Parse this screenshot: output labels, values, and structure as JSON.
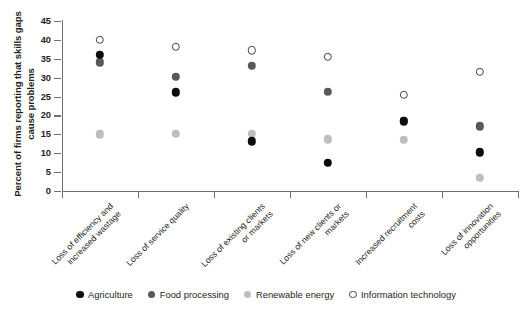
{
  "chart_data": {
    "type": "scatter",
    "title": "",
    "xlabel": "",
    "ylabel": "Percent of firms reporting that skills gaps cause problems",
    "ylim": [
      0,
      45
    ],
    "yticks": [
      0,
      5,
      10,
      15,
      20,
      25,
      30,
      35,
      40,
      45
    ],
    "grid": false,
    "legend_position": "bottom",
    "categories": [
      "Loss of efficiency and increased wastage",
      "Loss of service quality",
      "Loss of existing clients or markets",
      "Loss of new clients or markets",
      "Increased recruitment costs",
      "Loss of innovation opportunities"
    ],
    "category_lines": [
      [
        "Loss of efficiency and",
        "increased wastage"
      ],
      [
        "Loss of service quality"
      ],
      [
        "Loss of existing clients",
        "or markets"
      ],
      [
        "Loss of new clients or",
        "markets"
      ],
      [
        "Increased recruitment",
        "costs"
      ],
      [
        "Loss of innovation",
        "opportunities"
      ]
    ],
    "series": [
      {
        "name": "Agriculture",
        "color": "#0d0d0d",
        "marker": "filled-circle",
        "values": [
          36.0,
          26.1,
          13.2,
          7.5,
          18.5,
          10.2
        ]
      },
      {
        "name": "Food processing",
        "color": "#58595b",
        "marker": "filled-circle",
        "values": [
          34.1,
          30.3,
          33.2,
          26.2,
          18.6,
          17.1
        ]
      },
      {
        "name": "Renewable energy",
        "color": "#bcbec0",
        "marker": "filled-circle",
        "values": [
          15.0,
          15.1,
          15.2,
          13.7,
          13.6,
          3.5
        ]
      },
      {
        "name": "Information technology",
        "color": "#ffffff",
        "marker": "open-circle",
        "values": [
          40.1,
          38.1,
          37.2,
          35.6,
          25.5,
          31.5
        ]
      }
    ]
  },
  "axis": {
    "y_title": "Percent of firms reporting that skills gaps cause problems"
  },
  "legend": {
    "items": [
      {
        "label": "Agriculture",
        "color": "#0d0d0d",
        "marker": "filled-circle"
      },
      {
        "label": "Food processing",
        "color": "#58595b",
        "marker": "filled-circle"
      },
      {
        "label": "Renewable energy",
        "color": "#bcbec0",
        "marker": "filled-circle"
      },
      {
        "label": "Information technology",
        "color": "#ffffff",
        "marker": "open-circle"
      }
    ]
  }
}
